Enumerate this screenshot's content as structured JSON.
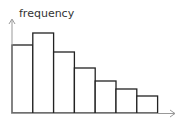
{
  "chart_data": {
    "type": "bar",
    "subtype": "histogram",
    "title": "",
    "xlabel": "",
    "ylabel": "frequency",
    "categories": [
      "1",
      "2",
      "3",
      "4",
      "5",
      "6",
      "7"
    ],
    "values": [
      68,
      80,
      61,
      45,
      32,
      24,
      17
    ],
    "value_units": "relative (no y-axis scale shown)",
    "grid": false,
    "legend": null,
    "axes": {
      "x_arrow": true,
      "y_arrow": true,
      "ticks": false
    },
    "colors": {
      "bar_fill": "#ffffff",
      "bar_stroke": "#222222",
      "axis": "#999999",
      "label": "#333333"
    }
  }
}
